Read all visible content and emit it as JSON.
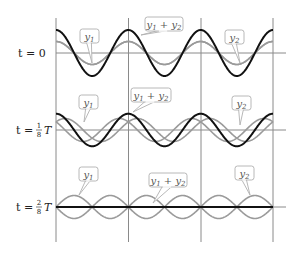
{
  "figure": {
    "colors": {
      "component_wave": "#9a9a9a",
      "sum_wave": "#111111",
      "grid": "#8a8a8a",
      "callout_border": "#b0b0b0",
      "callout_text": "#555555"
    },
    "rows": [
      {
        "label_prefix": "t = ",
        "label_value": "0",
        "label_fraction": null,
        "label_suffix": "",
        "phase_fraction": 0,
        "callouts": {
          "y1": "y1",
          "sum": "y1 + y2",
          "y2": "y2"
        }
      },
      {
        "label_prefix": "t = ",
        "label_value": "",
        "label_fraction": {
          "num": "1",
          "den": "8"
        },
        "label_suffix": "T",
        "phase_fraction": 0.125,
        "callouts": {
          "y1": "y1",
          "sum": "y1 + y2",
          "y2": "y2"
        }
      },
      {
        "label_prefix": "t = ",
        "label_value": "",
        "label_fraction": {
          "num": "2",
          "den": "8"
        },
        "label_suffix": "T",
        "phase_fraction": 0.25,
        "callouts": {
          "y1": "y1",
          "sum": "y1 + y2",
          "y2": "y2"
        }
      }
    ],
    "callout_labels": {
      "y1_main": "y",
      "y1_sub": "1",
      "plus": " + ",
      "y2_main": "y",
      "y2_sub": "2"
    },
    "row0_label": "t = 0",
    "row1_label_pre": "t = ",
    "row1_num": "1",
    "row1_den": "8",
    "row1_T": "T",
    "row2_label_pre": "t = ",
    "row2_num": "2",
    "row2_den": "8",
    "row2_T": "T"
  }
}
